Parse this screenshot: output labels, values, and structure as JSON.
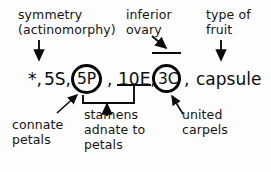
{
  "diagram": {
    "formula_text": "*, 5S, 5P, 10E, 3C, capsule"
  },
  "formula": {
    "symmetry_symbol": "*,",
    "sepals": "5S,",
    "petals": "5P",
    "comma_after_petals": ",",
    "stamens": "10E,",
    "carpels": "3C",
    "comma_after_carpels": ",",
    "fruit": "capsule"
  },
  "annotations": {
    "symmetry": {
      "line1": "symmetry",
      "line2": "(actinomorphy)"
    },
    "inferior_ovary": {
      "line1": "inferior",
      "line2": "ovary"
    },
    "type_of_fruit": {
      "line1": "type of",
      "line2": "fruit"
    },
    "connate_petals": {
      "line1": "connate",
      "line2": "petals"
    },
    "stamens_adnate": {
      "line1": "stamens",
      "line2": "adnate to",
      "line3": "petals"
    },
    "united_carpels": {
      "line1": "united",
      "line2": "carpels"
    }
  },
  "marks": {
    "circle_petals": "circled-5P",
    "circle_carpels": "circled-3C",
    "underline_stamens": "underline-10E",
    "ovary_bar": "bar-above-3C",
    "bracket_petals_stamens": "connecting-bracket"
  },
  "colors": {
    "ink": "#0c0c0c",
    "background": "#fdfdfd"
  }
}
